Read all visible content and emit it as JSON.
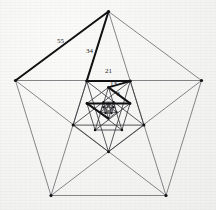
{
  "figure": {
    "type": "geometric-diagram",
    "background_color": "#f7f7f6",
    "line_color": "#54545a",
    "bold_line_color": "#121214",
    "vertex_color": "#121214",
    "width": 216,
    "height": 210
  },
  "labels": [
    {
      "text": "55",
      "x": 57,
      "y": 38,
      "size": "normal"
    },
    {
      "text": "34",
      "x": 86,
      "y": 48,
      "size": "normal"
    },
    {
      "text": "21",
      "x": 105,
      "y": 68,
      "size": "normal"
    },
    {
      "text": "13",
      "x": 110,
      "y": 81,
      "size": "normal"
    },
    {
      "text": "8",
      "x": 117,
      "y": 92,
      "size": "tiny"
    },
    {
      "text": "5",
      "x": 113,
      "y": 101,
      "size": "micro"
    },
    {
      "text": "3",
      "x": 109,
      "y": 108,
      "size": "micro"
    }
  ],
  "sequence": {
    "name": "Fibonacci",
    "values": [
      55,
      34,
      21,
      13,
      8,
      5,
      3
    ]
  },
  "pentagons": [
    {
      "level": 0,
      "label": "outer-pentagon",
      "vertices": [
        {
          "name": "top",
          "x": 108.5,
          "y": 11.5
        },
        {
          "name": "right",
          "x": 201.5,
          "y": 80.5
        },
        {
          "name": "bottom-right",
          "x": 166.0,
          "y": 195.5
        },
        {
          "name": "bottom-left",
          "x": 51.0,
          "y": 195.5
        },
        {
          "name": "left",
          "x": 15.5,
          "y": 80.5
        }
      ]
    },
    {
      "level": 1,
      "label": "pentagon-1",
      "vertices": [
        {
          "name": "bottom",
          "x": 108.5,
          "y": 151.8
        },
        {
          "name": "left",
          "x": 73.1,
          "y": 125.1
        },
        {
          "name": "upper-left",
          "x": 86.7,
          "y": 81.1
        },
        {
          "name": "upper-right",
          "x": 130.3,
          "y": 81.1
        },
        {
          "name": "right",
          "x": 143.9,
          "y": 125.1
        }
      ]
    },
    {
      "level": 2,
      "label": "pentagon-2",
      "vertices": [
        {
          "name": "top",
          "x": 108.5,
          "y": 87.4
        },
        {
          "name": "right",
          "x": 130.1,
          "y": 103.4
        },
        {
          "name": "bottom-right",
          "x": 121.9,
          "y": 130.0
        },
        {
          "name": "bottom-left",
          "x": 95.1,
          "y": 130.0
        },
        {
          "name": "left",
          "x": 86.9,
          "y": 103.4
        }
      ]
    },
    {
      "level": 3,
      "label": "pentagon-3",
      "vertices": [
        {
          "name": "bottom",
          "x": 108.5,
          "y": 118.5
        },
        {
          "name": "left",
          "x": 100.3,
          "y": 112.3
        },
        {
          "name": "upper-left",
          "x": 103.4,
          "y": 102.1
        },
        {
          "name": "upper-right",
          "x": 113.6,
          "y": 102.1
        },
        {
          "name": "right",
          "x": 116.7,
          "y": 112.3
        }
      ]
    },
    {
      "level": 4,
      "label": "pentagon-4",
      "vertices": [
        {
          "name": "top",
          "x": 108.5,
          "y": 103.5
        },
        {
          "name": "right",
          "x": 113.5,
          "y": 107.2
        },
        {
          "name": "bottom-right",
          "x": 111.6,
          "y": 113.3
        },
        {
          "name": "bottom-left",
          "x": 105.4,
          "y": 113.3
        },
        {
          "name": "left",
          "x": 103.5,
          "y": 107.2
        }
      ]
    }
  ],
  "bold_chain": {
    "description": "Bold Fibonacci edge chain from outer pentagon spiralling inward",
    "segments": [
      {
        "value": 55,
        "x1": 15.5,
        "y1": 80.5,
        "x2": 108.5,
        "y2": 11.5
      },
      {
        "value": 34,
        "x1": 108.5,
        "y1": 11.5,
        "x2": 86.7,
        "y2": 81.1
      },
      {
        "value": 21,
        "x1": 86.7,
        "y1": 81.1,
        "x2": 130.3,
        "y2": 81.1
      },
      {
        "value": 13,
        "x1": 130.3,
        "y1": 81.1,
        "x2": 108.5,
        "y2": 87.4
      },
      {
        "value": 8,
        "x1": 108.5,
        "y1": 87.4,
        "x2": 130.1,
        "y2": 103.4
      },
      {
        "value": 5,
        "x1": 130.1,
        "y1": 103.4,
        "x2": 86.9,
        "y2": 103.4
      },
      {
        "value": 3,
        "x1": 86.9,
        "y1": 103.4,
        "x2": 108.5,
        "y2": 118.5
      }
    ]
  }
}
